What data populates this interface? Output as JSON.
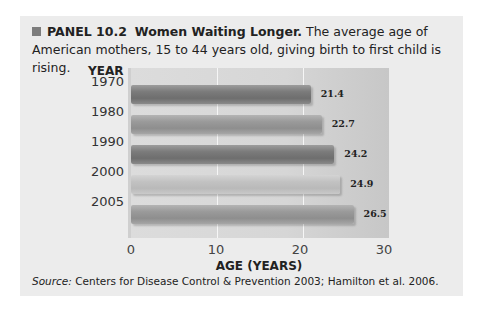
{
  "panel": {
    "label": "PANEL 10.2",
    "title": "Women Waiting Longer.",
    "description": "The average age of American mothers, 15 to 44 years old, giving birth to first child is rising.",
    "source_label": "Source:",
    "source_text": "Centers for Disease Control & Prevention 2003; Hamilton et al. 2006."
  },
  "chart_data": {
    "type": "bar",
    "orientation": "horizontal",
    "title": "Women Waiting Longer.",
    "xlabel": "AGE (YEARS)",
    "ylabel": "YEAR",
    "categories": [
      "1970",
      "1980",
      "1990",
      "2000",
      "2005"
    ],
    "values": [
      21.4,
      22.7,
      24.2,
      24.9,
      26.5
    ],
    "value_labels": [
      "21.4",
      "22.7",
      "24.2",
      "24.9",
      "26.5"
    ],
    "bar_shades": [
      "dark",
      "mid",
      "dark",
      "light",
      "mid"
    ],
    "xlim": [
      0,
      30
    ],
    "xticks": [
      "0",
      "10",
      "20",
      "30"
    ],
    "grid": true,
    "legend": null
  }
}
